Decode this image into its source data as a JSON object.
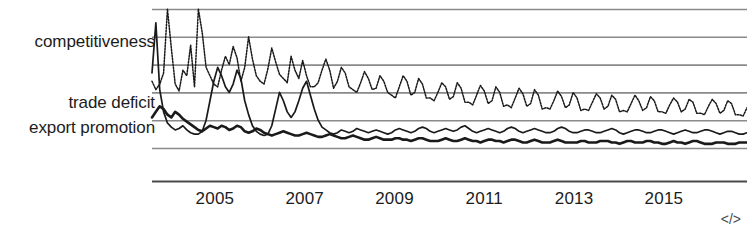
{
  "chart_data": {
    "type": "line",
    "title": "",
    "subtitle": "",
    "xlabel": "",
    "ylabel": "",
    "grid": true,
    "legend_position": "left-inline",
    "xlim": [
      2003.6,
      2016.85
    ],
    "ylim": [
      0,
      100
    ],
    "x_tick_labels": [
      "2005",
      "2007",
      "2009",
      "2011",
      "2013",
      "2015"
    ],
    "x_tick_values": [
      2005,
      2007,
      2009,
      2011,
      2013,
      2015
    ],
    "y_gridlines": [
      100,
      80,
      60,
      40,
      20,
      0
    ],
    "series": [
      {
        "name": "competitiveness",
        "style": "dotted",
        "color": "#1a1a1a",
        "values": [
          48,
          42,
          46,
          54,
          100,
          72,
          46,
          41,
          56,
          52,
          74,
          44,
          100,
          83,
          58,
          52,
          46,
          44,
          56,
          66,
          60,
          73,
          65,
          48,
          58,
          80,
          64,
          52,
          48,
          46,
          57,
          72,
          62,
          53,
          50,
          47,
          66,
          56,
          50,
          63,
          52,
          44,
          44,
          47,
          56,
          64,
          56,
          43,
          48,
          58,
          54,
          44,
          42,
          40,
          47,
          55,
          50,
          42,
          43,
          52,
          48,
          40,
          38,
          36,
          44,
          52,
          48,
          38,
          40,
          50,
          46,
          36,
          36,
          34,
          40,
          47,
          44,
          35,
          37,
          47,
          43,
          33,
          33,
          31,
          38,
          45,
          41,
          32,
          34,
          44,
          40,
          30,
          31,
          29,
          36,
          43,
          39,
          30,
          32,
          42,
          38,
          28,
          29,
          28,
          34,
          41,
          37,
          29,
          31,
          40,
          36,
          27,
          28,
          27,
          33,
          39,
          36,
          28,
          30,
          38,
          35,
          26,
          27,
          26,
          32,
          38,
          34,
          27,
          29,
          37,
          34,
          26,
          26,
          25,
          31,
          36,
          33,
          26,
          28,
          35,
          33,
          25,
          25,
          24,
          30,
          35,
          32,
          25,
          27,
          34,
          32,
          24,
          24,
          23,
          29
        ]
      },
      {
        "name": "trade deficit",
        "style": "solid-thin",
        "color": "#1a1a1a",
        "values": [
          54,
          90,
          42,
          26,
          18,
          15,
          13,
          14,
          16,
          13,
          11,
          10,
          10,
          12,
          20,
          34,
          48,
          58,
          52,
          44,
          40,
          46,
          56,
          50,
          34,
          24,
          16,
          12,
          10,
          9,
          10,
          16,
          28,
          40,
          34,
          26,
          22,
          26,
          34,
          43,
          48,
          38,
          28,
          20,
          15,
          13,
          11,
          10,
          11,
          13,
          12,
          11,
          12,
          14,
          13,
          12,
          11,
          12,
          13,
          12,
          11,
          10,
          11,
          13,
          14,
          13,
          12,
          11,
          12,
          14,
          15,
          14,
          12,
          11,
          12,
          13,
          14,
          13,
          12,
          13,
          15,
          16,
          14,
          12,
          11,
          12,
          13,
          14,
          13,
          12,
          11,
          12,
          14,
          15,
          14,
          12,
          11,
          12,
          13,
          14,
          13,
          12,
          11,
          11,
          12,
          14,
          15,
          14,
          12,
          11,
          11,
          12,
          13,
          13,
          12,
          11,
          11,
          12,
          13,
          14,
          13,
          11,
          10,
          11,
          12,
          13,
          13,
          12,
          11,
          11,
          12,
          13,
          13,
          12,
          11,
          10,
          11,
          12,
          13,
          12,
          11,
          11,
          12,
          13,
          13,
          12,
          11,
          10,
          11,
          12,
          12,
          11,
          10,
          10,
          11
        ]
      },
      {
        "name": "export promotion",
        "style": "solid-thick",
        "color": "#1a1a1a",
        "values": [
          22,
          26,
          30,
          28,
          24,
          22,
          26,
          24,
          21,
          19,
          17,
          15,
          13,
          12,
          14,
          16,
          15,
          14,
          16,
          15,
          13,
          14,
          16,
          15,
          12,
          11,
          12,
          14,
          13,
          11,
          10,
          9,
          10,
          11,
          12,
          11,
          10,
          9,
          9,
          10,
          11,
          10,
          9,
          8,
          8,
          9,
          10,
          9,
          8,
          7,
          7,
          8,
          9,
          8,
          7,
          6,
          6,
          7,
          8,
          7,
          6,
          6,
          6,
          7,
          7,
          6,
          6,
          5,
          6,
          7,
          7,
          6,
          5,
          5,
          5,
          6,
          7,
          6,
          5,
          5,
          6,
          7,
          6,
          5,
          5,
          4,
          5,
          6,
          6,
          5,
          5,
          4,
          5,
          6,
          6,
          5,
          4,
          4,
          5,
          6,
          5,
          4,
          4,
          4,
          5,
          6,
          5,
          4,
          4,
          4,
          4,
          5,
          5,
          4,
          4,
          4,
          5,
          5,
          5,
          4,
          4,
          3,
          4,
          5,
          5,
          4,
          4,
          4,
          5,
          5,
          4,
          4,
          3,
          3,
          4,
          5,
          4,
          4,
          3,
          4,
          5,
          5,
          4,
          3,
          3,
          3,
          4,
          4,
          4,
          3,
          3,
          3,
          4,
          4,
          4
        ]
      }
    ],
    "annotations": [
      {
        "name": "code-badge",
        "text": "</>"
      }
    ]
  },
  "labels": {
    "competitiveness": "competitiveness",
    "trade_deficit": "trade deficit",
    "export_promotion": "export promotion"
  },
  "badge": {
    "code": "</>"
  },
  "colors": {
    "line": "#1a1a1a",
    "grid": "#8a8a8a",
    "axis": "#4a4a4a",
    "text": "#1c1c1c",
    "background": "#ffffff"
  }
}
